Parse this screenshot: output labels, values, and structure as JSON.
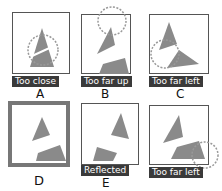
{
  "panels": [
    {
      "id": "A",
      "letter": "A",
      "caption": "Too close"
    },
    {
      "id": "B",
      "letter": "B",
      "caption": "Too far up"
    },
    {
      "id": "C",
      "letter": "C",
      "caption": "Too far left"
    },
    {
      "id": "D",
      "letter": "D",
      "caption": ""
    },
    {
      "id": "E",
      "letter": "E",
      "caption": "Reflected"
    },
    {
      "id": "F",
      "letter": "F",
      "caption": "Too far left"
    }
  ],
  "colors": {
    "shape": "#8a8a8a",
    "frame": "#555555",
    "label_bg": "#3a3a3a"
  }
}
